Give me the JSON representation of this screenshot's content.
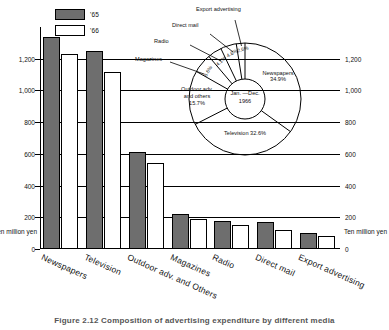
{
  "legend": {
    "items": [
      {
        "label": "'65",
        "style": "filled",
        "color": "#6e6e6e"
      },
      {
        "label": "'66",
        "style": "open",
        "color": "#ffffff"
      }
    ]
  },
  "axis": {
    "unit_left": "Ten million yen",
    "unit_right": "Ten million yen",
    "ticks": [
      "0",
      "200",
      "400",
      "600",
      "800",
      "1,000",
      "1,200"
    ]
  },
  "caption": "Figure 2.12  Composition of advertising expenditure by different media",
  "pie": {
    "center_line1": "Jan. —Dec.",
    "center_line2": "1966",
    "callouts": [
      {
        "name": "export-advertising",
        "label": "Export advertising"
      },
      {
        "name": "direct-mail",
        "label": "Direct mail"
      },
      {
        "name": "radio",
        "label": "Radio"
      },
      {
        "name": "magazines",
        "label": "Magazines"
      }
    ],
    "inside_labels": [
      {
        "name": "newspapers",
        "line1": "Newspapers",
        "line2": "34.9%"
      },
      {
        "name": "television",
        "line1": "Television 32.6%",
        "line2": ""
      },
      {
        "name": "outdoor",
        "line1": "Outdoor adv.",
        "line2": "and others",
        "line3": "15.7%"
      }
    ],
    "slice_pcts": [
      "5.6%",
      "4.1%",
      "4.6%",
      "2.6%"
    ]
  },
  "chart_data": {
    "type": "bar",
    "title": "Composition of advertising expenditure by different media",
    "xlabel": "",
    "ylabel": "Ten million yen",
    "ylim": [
      0,
      1400
    ],
    "yticks": [
      0,
      200,
      400,
      600,
      800,
      1000,
      1200
    ],
    "grid": true,
    "legend_position": "top-left",
    "categories": [
      "Newspapers",
      "Television",
      "Outdoor adv. and Others",
      "Magazines",
      "Radio",
      "Direct mail",
      "Export advertising"
    ],
    "series": [
      {
        "name": "'65",
        "values": [
          1340,
          1250,
          612,
          222,
          178,
          168,
          103
        ]
      },
      {
        "name": "'66",
        "values": [
          1228,
          1115,
          540,
          192,
          152,
          118,
          85
        ]
      }
    ],
    "inset": {
      "type": "pie",
      "title": "Jan. —Dec. 1966",
      "labels": [
        "Newspapers",
        "Television",
        "Outdoor adv. and others",
        "Magazines",
        "Radio",
        "Direct mail",
        "Export advertising"
      ],
      "values": [
        34.9,
        32.6,
        15.7,
        5.6,
        4.1,
        4.6,
        2.6
      ]
    }
  }
}
